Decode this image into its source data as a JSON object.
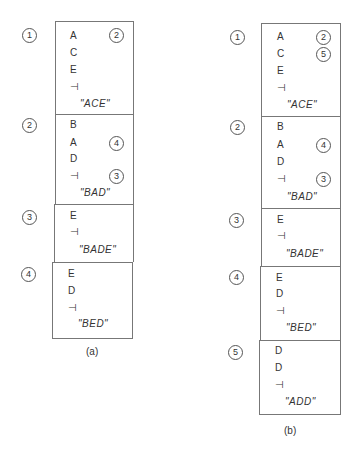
{
  "figure_a": {
    "caption": "(a)",
    "nodes": [
      {
        "id": "1",
        "symbols": [
          "A",
          "C",
          "E",
          "⊣"
        ],
        "pointers": {
          "0": "2"
        },
        "word": "\"ACE\""
      },
      {
        "id": "2",
        "symbols": [
          "B",
          "A",
          "D",
          "⊣"
        ],
        "pointers": {
          "1": "4",
          "3": "3"
        },
        "word": "\"BAD\""
      },
      {
        "id": "3",
        "symbols": [
          "E",
          "⊣"
        ],
        "pointers": {},
        "word": "\"BADE\""
      },
      {
        "id": "4",
        "symbols": [
          "E",
          "D",
          "⊣"
        ],
        "pointers": {},
        "word": "\"BED\""
      }
    ]
  },
  "figure_b": {
    "caption": "(b)",
    "nodes": [
      {
        "id": "1",
        "symbols": [
          "A",
          "C",
          "E",
          "⊣"
        ],
        "pointers": {
          "0": "2",
          "1": "5"
        },
        "word": "\"ACE\""
      },
      {
        "id": "2",
        "symbols": [
          "B",
          "A",
          "D",
          "⊣"
        ],
        "pointers": {
          "1": "4",
          "3": "3"
        },
        "word": "\"BAD\""
      },
      {
        "id": "3",
        "symbols": [
          "E",
          "⊣"
        ],
        "pointers": {},
        "word": "\"BADE\""
      },
      {
        "id": "4",
        "symbols": [
          "E",
          "D",
          "⊣"
        ],
        "pointers": {},
        "word": "\"BED\""
      },
      {
        "id": "5",
        "symbols": [
          "D",
          "D",
          "⊣"
        ],
        "pointers": {},
        "word": "\"ADD\""
      }
    ]
  }
}
